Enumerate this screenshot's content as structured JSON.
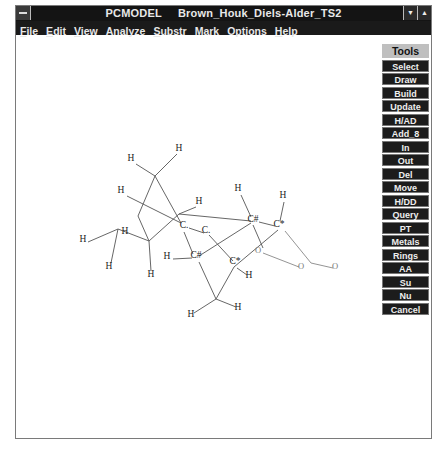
{
  "window": {
    "app_name": "PCMODEL",
    "document_name": "Brown_Houk_Diels-Alder_TS2",
    "buttons": {
      "minimize": "▼",
      "maximize": "▲"
    }
  },
  "menu": [
    {
      "label": "File",
      "accel": "F",
      "rest": "ile"
    },
    {
      "label": "Edit",
      "accel": "E",
      "rest": "dit"
    },
    {
      "label": "View",
      "accel": "V",
      "rest": "iew"
    },
    {
      "label": "Analyze",
      "accel": "",
      "rest": "Analyze"
    },
    {
      "label": "Substr",
      "accel": "S",
      "rest": "ubstr"
    },
    {
      "label": "Mark",
      "accel": "",
      "rest": "Mark"
    },
    {
      "label": "Options",
      "accel": "",
      "rest": "Options"
    },
    {
      "label": "Help",
      "accel": "H",
      "rest": "elp"
    }
  ],
  "tools": {
    "header": "Tools",
    "buttons": [
      "Select",
      "Draw",
      "Build",
      "Update",
      "H/AD",
      "Add_8",
      "In",
      "Out",
      "Del",
      "Move",
      "H/DD",
      "Query",
      "PT",
      "Metals",
      "Rings",
      "AA",
      "Su",
      "Nu",
      "Cancel"
    ]
  },
  "molecule": {
    "atoms": [
      {
        "id": "c1",
        "label": "C.",
        "x": 183,
        "y": 227
      },
      {
        "id": "c2",
        "label": "C.",
        "x": 205,
        "y": 232
      },
      {
        "id": "c3",
        "label": "C#",
        "x": 195,
        "y": 257
      },
      {
        "id": "c4",
        "label": "C*",
        "x": 234,
        "y": 263
      },
      {
        "id": "c5",
        "label": "C#",
        "x": 252,
        "y": 221
      },
      {
        "id": "c6",
        "label": "C*",
        "x": 278,
        "y": 226
      },
      {
        "id": "o1",
        "label": "O",
        "x": 257,
        "y": 252
      },
      {
        "id": "o2",
        "label": "O",
        "x": 300,
        "y": 268
      },
      {
        "id": "o3",
        "label": "O",
        "x": 334,
        "y": 268
      },
      {
        "id": "h1",
        "label": "H",
        "x": 130,
        "y": 160
      },
      {
        "id": "h2",
        "label": "H",
        "x": 178,
        "y": 150
      },
      {
        "id": "h3",
        "label": "H",
        "x": 120,
        "y": 192
      },
      {
        "id": "h4",
        "label": "H",
        "x": 198,
        "y": 203
      },
      {
        "id": "h5",
        "label": "H",
        "x": 82,
        "y": 241
      },
      {
        "id": "h6",
        "label": "H",
        "x": 124,
        "y": 233
      },
      {
        "id": "h7",
        "label": "H",
        "x": 108,
        "y": 268
      },
      {
        "id": "h8",
        "label": "H",
        "x": 150,
        "y": 276
      },
      {
        "id": "h9",
        "label": "H",
        "x": 166,
        "y": 258
      },
      {
        "id": "h10",
        "label": "H",
        "x": 237,
        "y": 190
      },
      {
        "id": "h11",
        "label": "H",
        "x": 282,
        "y": 197
      },
      {
        "id": "h12",
        "label": "H",
        "x": 248,
        "y": 277
      },
      {
        "id": "h13",
        "label": "H",
        "x": 190,
        "y": 316
      },
      {
        "id": "h14",
        "label": "H",
        "x": 237,
        "y": 309
      }
    ],
    "points": {
      "a": [
        154,
        175
      ],
      "b": [
        137,
        215
      ],
      "c": [
        148,
        240
      ],
      "d": [
        117,
        228
      ],
      "e": [
        178,
        213
      ],
      "f": [
        215,
        298
      ]
    },
    "bonds": [
      [
        [
          135,
          163
        ],
        [
          154,
          175
        ]
      ],
      [
        [
          176,
          153
        ],
        [
          154,
          175
        ]
      ],
      [
        [
          154,
          175
        ],
        [
          137,
          215
        ]
      ],
      [
        [
          154,
          175
        ],
        [
          180,
          222
        ]
      ],
      [
        [
          126,
          195
        ],
        [
          180,
          222
        ]
      ],
      [
        [
          137,
          215
        ],
        [
          148,
          240
        ]
      ],
      [
        [
          87,
          241
        ],
        [
          117,
          228
        ]
      ],
      [
        [
          117,
          228
        ],
        [
          148,
          240
        ]
      ],
      [
        [
          117,
          228
        ],
        [
          110,
          262
        ]
      ],
      [
        [
          148,
          240
        ],
        [
          150,
          270
        ]
      ],
      [
        [
          148,
          240
        ],
        [
          178,
          213
        ]
      ],
      [
        [
          178,
          213
        ],
        [
          195,
          206
        ]
      ],
      [
        [
          178,
          213
        ],
        [
          250,
          220
        ]
      ],
      [
        [
          188,
          227
        ],
        [
          203,
          232
        ]
      ],
      [
        [
          208,
          234
        ],
        [
          232,
          260
        ]
      ],
      [
        [
          183,
          231
        ],
        [
          192,
          253
        ]
      ],
      [
        [
          172,
          258
        ],
        [
          191,
          257
        ]
      ],
      [
        [
          198,
          261
        ],
        [
          215,
          298
        ]
      ],
      [
        [
          236,
          267
        ],
        [
          246,
          274
        ]
      ],
      [
        [
          215,
          298
        ],
        [
          193,
          312
        ]
      ],
      [
        [
          215,
          298
        ],
        [
          235,
          306
        ]
      ],
      [
        [
          215,
          298
        ],
        [
          233,
          266
        ]
      ],
      [
        [
          233,
          266
        ],
        [
          277,
          229
        ]
      ],
      [
        [
          198,
          255
        ],
        [
          250,
          222
        ]
      ],
      [
        [
          240,
          194
        ],
        [
          250,
          216
        ]
      ],
      [
        [
          258,
          221
        ],
        [
          274,
          225
        ]
      ],
      [
        [
          283,
          201
        ],
        [
          279,
          220
        ]
      ],
      [
        [
          252,
          224
        ],
        [
          262,
          247
        ]
      ],
      [
        [
          284,
          230
        ],
        [
          310,
          262
        ]
      ],
      [
        [
          262,
          252
        ],
        [
          298,
          266
        ]
      ],
      [
        [
          310,
          262
        ],
        [
          332,
          267
        ]
      ]
    ]
  }
}
